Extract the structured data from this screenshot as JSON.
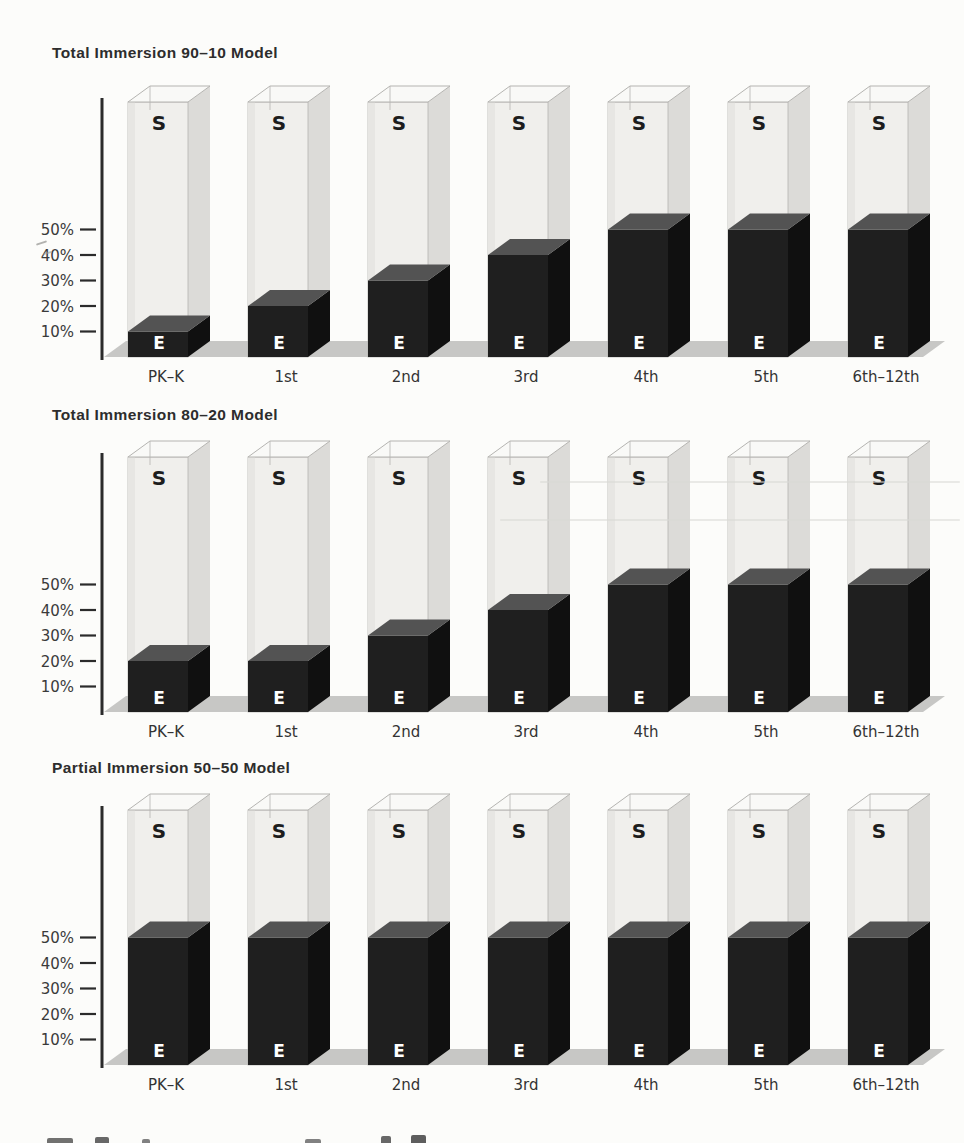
{
  "colors": {
    "axis": "#2b2b2b",
    "floor": "#c7c7c5",
    "english_front": "#1f1f1f",
    "english_side": "#101010",
    "english_top": "#535353",
    "spanish_front": "#f0efec",
    "spanish_side": "#dcdbd8",
    "spanish_shade": "#e7e6e3",
    "spanish_top": "#f9f9f7",
    "spanish_edge": "#b5b4b1"
  },
  "chart_data": [
    {
      "type": "bar",
      "variant": "3d-stacked-column",
      "title": "Total Immersion 90–10 Model",
      "categories": [
        "PK–K",
        "1st",
        "2nd",
        "3rd",
        "4th",
        "5th",
        "6th–12th"
      ],
      "series": [
        {
          "name": "English instruction",
          "label": "E",
          "values": [
            10,
            20,
            30,
            40,
            50,
            50,
            50
          ]
        },
        {
          "name": "Spanish instruction",
          "label": "S",
          "values": [
            90,
            80,
            70,
            60,
            50,
            50,
            50
          ]
        }
      ],
      "yticks": [
        "50%",
        "40%",
        "30%",
        "20%",
        "10%"
      ],
      "ylim": [
        0,
        100
      ],
      "xlabel": "",
      "ylabel": "",
      "grid": false,
      "legend": "none"
    },
    {
      "type": "bar",
      "variant": "3d-stacked-column",
      "title": "Total Immersion 80–20 Model",
      "categories": [
        "PK–K",
        "1st",
        "2nd",
        "3rd",
        "4th",
        "5th",
        "6th–12th"
      ],
      "series": [
        {
          "name": "English instruction",
          "label": "E",
          "values": [
            20,
            20,
            30,
            40,
            50,
            50,
            50
          ]
        },
        {
          "name": "Spanish instruction",
          "label": "S",
          "values": [
            80,
            80,
            70,
            60,
            50,
            50,
            50
          ]
        }
      ],
      "yticks": [
        "50%",
        "40%",
        "30%",
        "20%",
        "10%"
      ],
      "ylim": [
        0,
        100
      ],
      "xlabel": "",
      "ylabel": "",
      "grid": false,
      "legend": "none"
    },
    {
      "type": "bar",
      "variant": "3d-stacked-column",
      "title": "Partial Immersion 50–50 Model",
      "categories": [
        "PK–K",
        "1st",
        "2nd",
        "3rd",
        "4th",
        "5th",
        "6th–12th"
      ],
      "series": [
        {
          "name": "English instruction",
          "label": "E",
          "values": [
            50,
            50,
            50,
            50,
            50,
            50,
            50
          ]
        },
        {
          "name": "Spanish instruction",
          "label": "S",
          "values": [
            50,
            50,
            50,
            50,
            50,
            50,
            50
          ]
        }
      ],
      "yticks": [
        "50%",
        "40%",
        "30%",
        "20%",
        "10%"
      ],
      "ylim": [
        0,
        100
      ],
      "xlabel": "",
      "ylabel": "",
      "grid": false,
      "legend": "none"
    }
  ]
}
